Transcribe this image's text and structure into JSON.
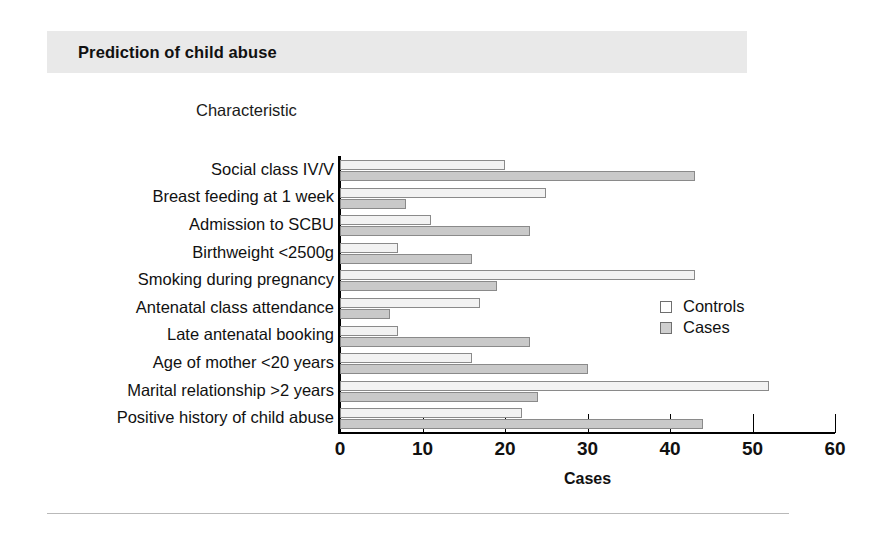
{
  "header": {
    "title": "Prediction of child abuse"
  },
  "chart_axis_header": "Characteristic",
  "legend": {
    "position": "inside-right",
    "items": [
      {
        "label": "Controls",
        "swatch": "open-square",
        "color": "#ffffff"
      },
      {
        "label": "Cases",
        "swatch": "filled-square",
        "color": "#cfcfcf"
      }
    ]
  },
  "chart_data": {
    "type": "bar",
    "orientation": "horizontal",
    "title": "Prediction of child abuse",
    "xlabel": "Cases",
    "ylabel": "Characteristic",
    "xlim": [
      0,
      60
    ],
    "xticks": [
      0,
      10,
      20,
      30,
      40,
      50,
      60
    ],
    "grid": false,
    "legend_position": "inside-right",
    "categories": [
      "Social class IV/V",
      "Breast feeding at 1 week",
      "Admission to SCBU",
      "Birthweight <2500g",
      "Smoking during pregnancy",
      "Antenatal class attendance",
      "Late antenatal booking",
      "Age of mother <20 years",
      "Marital relationship >2 years",
      "Positive history of child abuse"
    ],
    "series": [
      {
        "name": "Controls",
        "color": "#f2f2f2",
        "values": [
          20,
          25,
          11,
          7,
          43,
          17,
          7,
          16,
          52,
          22
        ]
      },
      {
        "name": "Cases",
        "color": "#c9c9c9",
        "values": [
          43,
          8,
          23,
          16,
          19,
          6,
          23,
          30,
          24,
          44
        ]
      }
    ]
  }
}
